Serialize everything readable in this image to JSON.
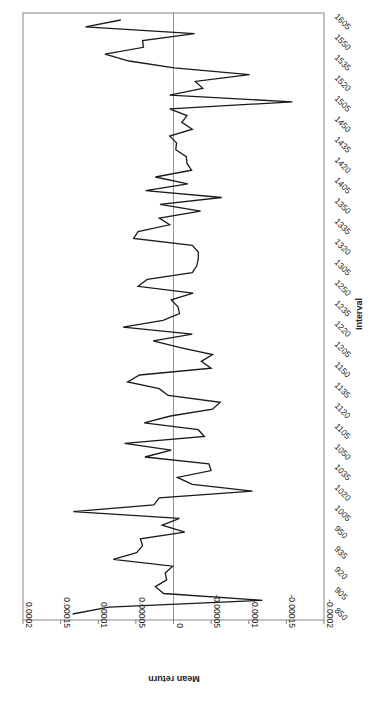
{
  "chart_data": {
    "type": "line",
    "orientation": "rotated-90-clockwise",
    "title": "",
    "xlabel": "Interval",
    "ylabel": "Mean return",
    "ylim": [
      -0.0002,
      0.0002
    ],
    "yticks": [
      "0.0002",
      "0.00015",
      "0.0001",
      "0.00005",
      "0",
      "-0.00005",
      "-0.0001",
      "-0.00015",
      "-0.0002"
    ],
    "ytick_values": [
      0.0002,
      0.00015,
      0.0001,
      5e-05,
      0,
      -5e-05,
      -0.0001,
      -0.00015,
      -0.0002
    ],
    "xtick_labels": [
      "850",
      "905",
      "920",
      "935",
      "950",
      "1005",
      "1020",
      "1035",
      "1050",
      "1105",
      "1120",
      "1135",
      "1150",
      "1205",
      "1220",
      "1235",
      "1250",
      "1305",
      "1320",
      "1335",
      "1350",
      "1405",
      "1420",
      "1435",
      "1450",
      "1505",
      "1520",
      "1535",
      "1550",
      "1605"
    ],
    "grid": false,
    "zero_line": true,
    "legend": null,
    "series": [
      {
        "name": "Mean return",
        "color": "#1a1a1a",
        "x": [
          "850",
          "855",
          "900",
          "905",
          "910",
          "915",
          "920",
          "925",
          "930",
          "935",
          "940",
          "945",
          "950",
          "955",
          "1000",
          "1005",
          "1010",
          "1015",
          "1020",
          "1025",
          "1030",
          "1035",
          "1040",
          "1045",
          "1050",
          "1055",
          "1100",
          "1105",
          "1110",
          "1115",
          "1120",
          "1125",
          "1130",
          "1135",
          "1140",
          "1145",
          "1150",
          "1155",
          "1200",
          "1205",
          "1210",
          "1215",
          "1220",
          "1225",
          "1230",
          "1235",
          "1240",
          "1245",
          "1250",
          "1255",
          "1300",
          "1305",
          "1310",
          "1315",
          "1320",
          "1325",
          "1330",
          "1335",
          "1340",
          "1345",
          "1350",
          "1355",
          "1400",
          "1405",
          "1410",
          "1415",
          "1420",
          "1425",
          "1430",
          "1435",
          "1440",
          "1445",
          "1450",
          "1455",
          "1500",
          "1505",
          "1510",
          "1515",
          "1520",
          "1525",
          "1530",
          "1535",
          "1540",
          "1545",
          "1550",
          "1555",
          "1600",
          "1605"
        ],
        "values": [
          0.000134,
          8.6e-05,
          -0.000118,
          1.3e-05,
          2.4e-05,
          9e-06,
          1.1e-05,
          1e-06,
          8e-05,
          4.9e-05,
          4.1e-05,
          4.4e-05,
          -1.5e-05,
          1.5e-05,
          -8e-06,
          0.000133,
          2.6e-05,
          1.9e-05,
          -0.000105,
          -2.5e-05,
          -5e-06,
          -5e-05,
          -4.7e-05,
          3.8e-05,
          3e-06,
          6.5e-05,
          -4.1e-05,
          -3.3e-05,
          3.9e-05,
          4e-06,
          -5.2e-05,
          -6.2e-05,
          7e-06,
          1.9e-05,
          6.1e-05,
          4.5e-05,
          -5e-05,
          -3.7e-05,
          -5.2e-05,
          -9e-06,
          2.7e-05,
          -2.5e-05,
          6.7e-05,
          1.4e-05,
          -8e-06,
          -6e-06,
          3e-06,
          -2.6e-05,
          4.7e-05,
          3.5e-05,
          -2.5e-05,
          -3.1e-05,
          -3.3e-05,
          -3.3e-05,
          -2.5e-05,
          5.3e-05,
          4.7e-05,
          5e-06,
          1.9e-05,
          -3.6e-05,
          1.8e-05,
          -6.4e-05,
          3.7e-05,
          -1.9e-05,
          2.4e-05,
          -2.4e-05,
          -1.8e-05,
          -1.7e-05,
          -3e-06,
          -4e-06,
          5e-06,
          -2.5e-05,
          -1.1e-05,
          -1.8e-05,
          5e-06,
          -0.000158,
          5e-06,
          -3.9e-05,
          -2.9e-05,
          -0.000101,
          -1e-06,
          5.9e-05,
          9.1e-05,
          4e-05,
          4.1e-05,
          -2.8e-05,
          0.000117,
          7e-05
        ]
      }
    ]
  }
}
